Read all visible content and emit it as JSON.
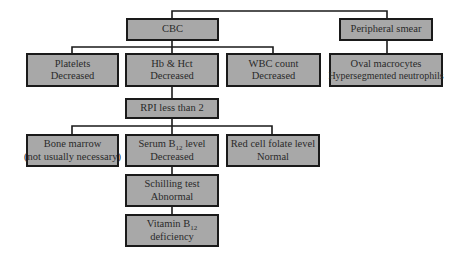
{
  "colors": {
    "box_fill": "#a8a8a8",
    "border": "#1a1a1a",
    "text": "#2a2a2a"
  },
  "nodes": {
    "cbc": {
      "line1": "CBC"
    },
    "peripheral_smear": {
      "line1": "Peripheral smear"
    },
    "platelets": {
      "line1": "Platelets",
      "line2": "Decreased"
    },
    "hb_hct": {
      "line1": "Hb & Hct",
      "line2": "Decreased"
    },
    "wbc": {
      "line1": "WBC count",
      "line2": "Decreased"
    },
    "oval": {
      "line1": "Oval macrocytes",
      "line2": "Hypersegmented neutrophils"
    },
    "rpi": {
      "line1": "RPI less than 2"
    },
    "bone_marrow": {
      "line1": "Bone marrow",
      "line2": "(not usually necessary)"
    },
    "serum_b12": {
      "line1_pre": "Serum B",
      "line1_sub": "12",
      "line1_post": " level",
      "line2": "Decreased"
    },
    "red_cell_folate": {
      "line1": "Red cell folate level",
      "line2": "Normal"
    },
    "schilling": {
      "line1": "Schilling test",
      "line2": "Abnormal"
    },
    "vitamin_b12": {
      "line1_pre": "Vitamin B",
      "line1_sub": "12",
      "line2": "deficiency"
    }
  },
  "edges": [
    [
      "root",
      "cbc"
    ],
    [
      "root",
      "peripheral_smear"
    ],
    [
      "cbc",
      "platelets"
    ],
    [
      "cbc",
      "hb_hct"
    ],
    [
      "cbc",
      "wbc"
    ],
    [
      "peripheral_smear",
      "oval"
    ],
    [
      "hb_hct",
      "rpi"
    ],
    [
      "rpi",
      "bone_marrow"
    ],
    [
      "rpi",
      "serum_b12"
    ],
    [
      "rpi",
      "red_cell_folate"
    ],
    [
      "serum_b12",
      "schilling"
    ],
    [
      "schilling",
      "vitamin_b12"
    ]
  ]
}
